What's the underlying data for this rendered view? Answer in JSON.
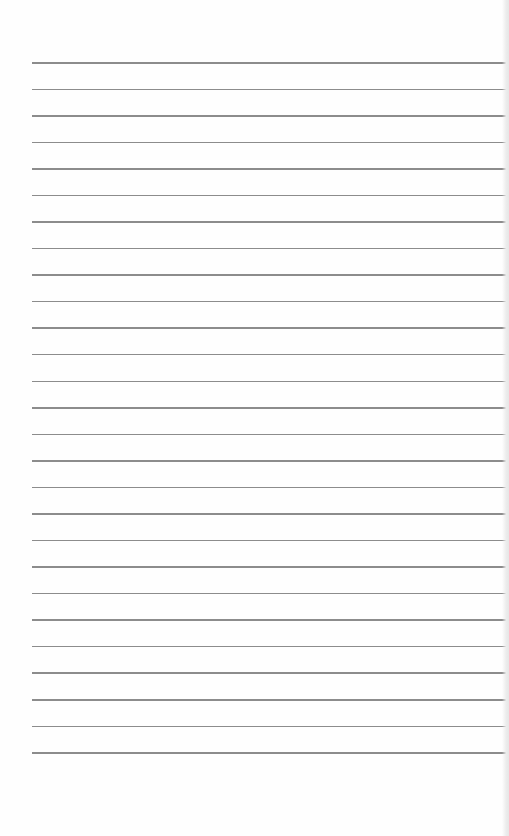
{
  "page": {
    "type": "blank-lined-sheet",
    "background_color": "#fefefe",
    "rule_color": "#8c8c8c",
    "rule_count": 27,
    "rule_start_y": 62,
    "rule_spacing": 26.54,
    "rule_left": 32,
    "rule_width": 474
  }
}
